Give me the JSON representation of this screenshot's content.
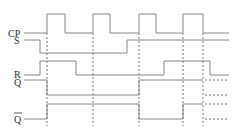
{
  "diagram": {
    "signals": [
      {
        "id": "cp",
        "label": "CP"
      },
      {
        "id": "s",
        "label": "S"
      },
      {
        "id": "r",
        "label": "R"
      },
      {
        "id": "q",
        "label": "Q"
      },
      {
        "id": "qbar",
        "label": "Q̄"
      }
    ],
    "clock_pulses": 4,
    "sequence": {
      "cp": [
        0,
        1,
        0,
        1,
        0,
        1,
        0,
        1,
        0
      ],
      "s": [
        1,
        0,
        1
      ],
      "r": [
        0,
        1,
        0,
        1,
        0
      ],
      "q": [
        "1",
        "indeterminate",
        "1",
        "unknown"
      ],
      "qbar": [
        "0",
        "indeterminate",
        "0",
        "indeterminate",
        "unknown"
      ]
    },
    "colors": {
      "line": "#888888",
      "dashed": "#777777",
      "text": "#333333"
    }
  }
}
